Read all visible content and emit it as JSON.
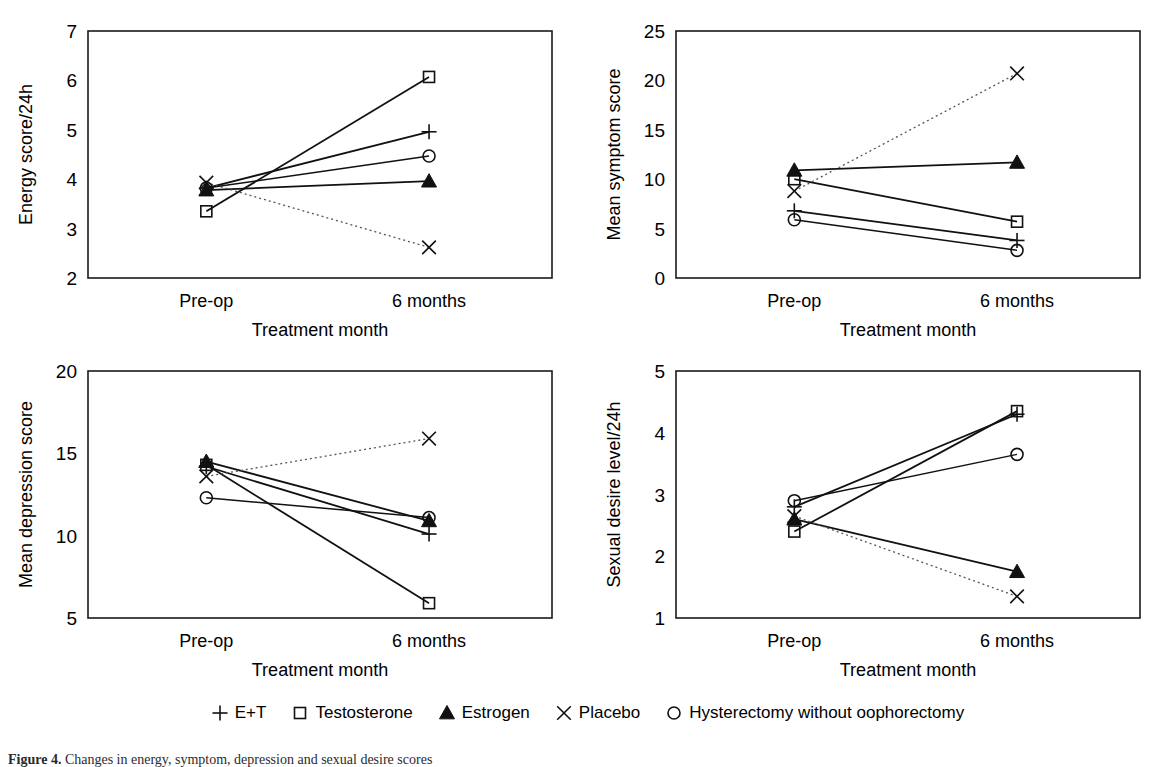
{
  "figure": {
    "caption_label": "Figure 4.",
    "caption_text": "Changes in energy, symptom, depression and sexual desire scores",
    "x_axis_title": "Treatment month",
    "categories": [
      "Pre-op",
      "6 months"
    ]
  },
  "legend": {
    "position": "bottom-center",
    "items": [
      {
        "label": "E+T",
        "marker": "plus-icon",
        "line": "solid"
      },
      {
        "label": "Testosterone",
        "marker": "open-square-icon",
        "line": "solid"
      },
      {
        "label": "Estrogen",
        "marker": "filled-triangle-icon",
        "line": "solid"
      },
      {
        "label": "Placebo",
        "marker": "cross-icon",
        "line": "dotted"
      },
      {
        "label": "Hysterectomy without oophorectomy",
        "marker": "open-circle-icon",
        "line": "dashed"
      }
    ]
  },
  "colors": {
    "line": "#111111",
    "dotted_line": "#555555",
    "frame": "#1a1a1a",
    "text": "#000000",
    "background": "#ffffff"
  },
  "chart_data": [
    {
      "id": "energy",
      "type": "line",
      "title": "",
      "xlabel": "Treatment month",
      "ylabel": "Energy score/24h",
      "categories": [
        "Pre-op",
        "6 months"
      ],
      "ylim": [
        2,
        7
      ],
      "yticks": [
        2,
        3,
        4,
        5,
        6,
        7
      ],
      "grid": false,
      "series": [
        {
          "name": "E+T",
          "marker": "plus-icon",
          "line": "solid",
          "values": [
            3.82,
            4.96
          ]
        },
        {
          "name": "Testosterone",
          "marker": "open-square-icon",
          "line": "solid",
          "values": [
            3.35,
            6.07
          ]
        },
        {
          "name": "Estrogen",
          "marker": "filled-triangle-icon",
          "line": "solid",
          "values": [
            3.78,
            3.96
          ]
        },
        {
          "name": "Placebo",
          "marker": "cross-icon",
          "line": "dotted",
          "values": [
            3.93,
            2.62
          ]
        },
        {
          "name": "Hysterectomy without oophorectomy",
          "marker": "open-circle-icon",
          "line": "dashed",
          "values": [
            3.82,
            4.47
          ]
        }
      ]
    },
    {
      "id": "symptom",
      "type": "line",
      "title": "",
      "xlabel": "Treatment month",
      "ylabel": "Mean symptom score",
      "categories": [
        "Pre-op",
        "6 months"
      ],
      "ylim": [
        0,
        25
      ],
      "yticks": [
        0,
        5,
        10,
        15,
        20,
        25
      ],
      "grid": false,
      "series": [
        {
          "name": "E+T",
          "marker": "plus-icon",
          "line": "solid",
          "values": [
            6.8,
            3.8
          ]
        },
        {
          "name": "Testosterone",
          "marker": "open-square-icon",
          "line": "solid",
          "values": [
            10.0,
            5.7
          ]
        },
        {
          "name": "Estrogen",
          "marker": "filled-triangle-icon",
          "line": "solid",
          "values": [
            10.9,
            11.7
          ]
        },
        {
          "name": "Placebo",
          "marker": "cross-icon",
          "line": "dotted",
          "values": [
            8.8,
            20.7
          ]
        },
        {
          "name": "Hysterectomy without oophorectomy",
          "marker": "open-circle-icon",
          "line": "dashed",
          "values": [
            5.9,
            2.8
          ]
        }
      ]
    },
    {
      "id": "depression",
      "type": "line",
      "title": "",
      "xlabel": "Treatment month",
      "ylabel": "Mean depression score",
      "categories": [
        "Pre-op",
        "6 months"
      ],
      "ylim": [
        5,
        20
      ],
      "yticks": [
        5,
        10,
        15,
        20
      ],
      "grid": false,
      "series": [
        {
          "name": "E+T",
          "marker": "plus-icon",
          "line": "solid",
          "values": [
            14.2,
            10.1
          ]
        },
        {
          "name": "Testosterone",
          "marker": "open-square-icon",
          "line": "solid",
          "values": [
            14.3,
            5.9
          ]
        },
        {
          "name": "Estrogen",
          "marker": "filled-triangle-icon",
          "line": "solid",
          "values": [
            14.5,
            10.9
          ]
        },
        {
          "name": "Placebo",
          "marker": "cross-icon",
          "line": "dotted",
          "values": [
            13.6,
            15.9
          ]
        },
        {
          "name": "Hysterectomy without oophorectomy",
          "marker": "open-circle-icon",
          "line": "dashed",
          "values": [
            12.3,
            11.1
          ]
        }
      ]
    },
    {
      "id": "desire",
      "type": "line",
      "title": "",
      "xlabel": "Treatment month",
      "ylabel": "Sexual desire level/24h",
      "categories": [
        "Pre-op",
        "6 months"
      ],
      "ylim": [
        1,
        5
      ],
      "yticks": [
        1,
        2,
        3,
        4,
        5
      ],
      "grid": false,
      "series": [
        {
          "name": "E+T",
          "marker": "plus-icon",
          "line": "solid",
          "values": [
            2.8,
            4.3
          ]
        },
        {
          "name": "Testosterone",
          "marker": "open-square-icon",
          "line": "solid",
          "values": [
            2.4,
            4.35
          ]
        },
        {
          "name": "Estrogen",
          "marker": "filled-triangle-icon",
          "line": "solid",
          "values": [
            2.6,
            1.75
          ]
        },
        {
          "name": "Placebo",
          "marker": "cross-icon",
          "line": "dotted",
          "values": [
            2.65,
            1.35
          ]
        },
        {
          "name": "Hysterectomy without oophorectomy",
          "marker": "open-circle-icon",
          "line": "dashed",
          "values": [
            2.9,
            3.65
          ]
        }
      ]
    }
  ]
}
